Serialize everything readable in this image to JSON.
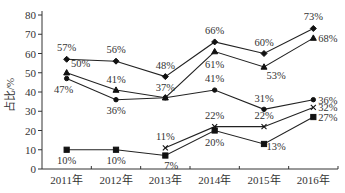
{
  "chart_data": {
    "type": "line",
    "title": "",
    "xlabel": "",
    "ylabel": "占比/%",
    "ylim": [
      0,
      80
    ],
    "yticks": [
      0,
      10,
      20,
      30,
      40,
      50,
      60,
      70,
      80
    ],
    "categories": [
      "2011年",
      "2012年",
      "2013年",
      "2014年",
      "2015年",
      "2016年"
    ],
    "grid": false,
    "legend": "none",
    "series": [
      {
        "name": "series-1",
        "marker": "diamond",
        "values": [
          57,
          56,
          48,
          66,
          60,
          73
        ],
        "labels": [
          "57%",
          "56%",
          "48%",
          "66%",
          "60%",
          "73%"
        ]
      },
      {
        "name": "series-2",
        "marker": "triangle",
        "values": [
          50,
          41,
          37,
          61,
          53,
          68
        ],
        "labels": [
          "50%",
          "41%",
          "37%",
          "61%",
          "53%",
          "68%"
        ]
      },
      {
        "name": "series-3",
        "marker": "circle",
        "values": [
          47,
          36,
          37,
          41,
          31,
          36
        ],
        "labels": [
          "47%",
          "36%",
          "",
          "41%",
          "31%",
          "36%"
        ]
      },
      {
        "name": "series-4",
        "marker": "x",
        "values": [
          null,
          null,
          11,
          22,
          22,
          32
        ],
        "labels": [
          "",
          "",
          "11%",
          "22%",
          "22%",
          "32%"
        ]
      },
      {
        "name": "series-5",
        "marker": "square",
        "values": [
          10,
          10,
          7,
          20,
          13,
          27
        ],
        "labels": [
          "10%",
          "10%",
          "7%",
          "20%",
          "13%",
          "27%"
        ]
      }
    ]
  }
}
